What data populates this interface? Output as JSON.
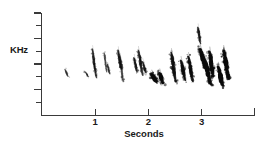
{
  "chart_data": {
    "type": "heatmap",
    "title": "",
    "subtitle": "",
    "xlabel": "Seconds",
    "ylabel": "KHz",
    "xlim": [
      0,
      4
    ],
    "ylim": [
      0,
      8
    ],
    "grid": false,
    "legend": "none",
    "x_ticks": [
      1,
      2,
      3
    ],
    "x_tick_labels": [
      "1",
      "2",
      "3"
    ],
    "y_ticks": [
      2,
      4,
      6,
      8
    ],
    "y_tick_labels": [
      "2",
      "4",
      "6",
      "8"
    ],
    "y_minor_ticks": [
      1,
      3,
      5,
      7
    ],
    "ink_color": "#111111",
    "axis_color": "#3a3a3a",
    "syllables": [
      {
        "t_start": 0.42,
        "t_end": 0.5,
        "f_start": 3.6,
        "f_end": 3.0,
        "intensity": 0.22
      },
      {
        "t_start": 0.8,
        "t_end": 0.88,
        "f_start": 3.4,
        "f_end": 3.0,
        "intensity": 0.2
      },
      {
        "t_start": 0.94,
        "t_end": 1.0,
        "f_start": 5.2,
        "f_end": 3.5,
        "intensity": 0.42
      },
      {
        "t_start": 0.97,
        "t_end": 1.03,
        "f_start": 4.1,
        "f_end": 2.9,
        "intensity": 0.35
      },
      {
        "t_start": 1.16,
        "t_end": 1.22,
        "f_start": 4.9,
        "f_end": 3.4,
        "intensity": 0.3
      },
      {
        "t_start": 1.22,
        "t_end": 1.28,
        "f_start": 4.0,
        "f_end": 3.2,
        "intensity": 0.26
      },
      {
        "t_start": 1.42,
        "t_end": 1.49,
        "f_start": 5.1,
        "f_end": 3.6,
        "intensity": 0.48
      },
      {
        "t_start": 1.46,
        "t_end": 1.53,
        "f_start": 4.6,
        "f_end": 2.6,
        "intensity": 0.4
      },
      {
        "t_start": 1.72,
        "t_end": 1.79,
        "f_start": 4.5,
        "f_end": 3.4,
        "intensity": 0.45
      },
      {
        "t_start": 1.8,
        "t_end": 1.9,
        "f_start": 5.1,
        "f_end": 3.1,
        "intensity": 0.55
      },
      {
        "t_start": 1.88,
        "t_end": 1.96,
        "f_start": 4.2,
        "f_end": 3.3,
        "intensity": 0.42
      },
      {
        "t_start": 2.05,
        "t_end": 2.16,
        "f_start": 3.2,
        "f_end": 2.6,
        "intensity": 0.85
      },
      {
        "t_start": 2.2,
        "t_end": 2.28,
        "f_start": 3.3,
        "f_end": 2.5,
        "intensity": 0.8
      },
      {
        "t_start": 2.42,
        "t_end": 2.52,
        "f_start": 4.9,
        "f_end": 2.6,
        "intensity": 0.75
      },
      {
        "t_start": 2.6,
        "t_end": 2.7,
        "f_start": 4.3,
        "f_end": 2.7,
        "intensity": 0.7
      },
      {
        "t_start": 2.74,
        "t_end": 2.84,
        "f_start": 4.6,
        "f_end": 2.6,
        "intensity": 0.72
      },
      {
        "t_start": 2.92,
        "t_end": 2.98,
        "f_start": 6.9,
        "f_end": 5.6,
        "intensity": 0.45
      },
      {
        "t_start": 2.96,
        "t_end": 3.08,
        "f_start": 5.2,
        "f_end": 3.6,
        "intensity": 0.9
      },
      {
        "t_start": 3.04,
        "t_end": 3.18,
        "f_start": 4.4,
        "f_end": 2.4,
        "intensity": 0.95
      },
      {
        "t_start": 3.14,
        "t_end": 3.22,
        "f_start": 5.0,
        "f_end": 3.0,
        "intensity": 0.88
      },
      {
        "t_start": 3.3,
        "t_end": 3.4,
        "f_start": 3.8,
        "f_end": 2.3,
        "intensity": 0.9
      },
      {
        "t_start": 3.4,
        "t_end": 3.52,
        "f_start": 5.1,
        "f_end": 2.8,
        "intensity": 0.95
      }
    ]
  }
}
